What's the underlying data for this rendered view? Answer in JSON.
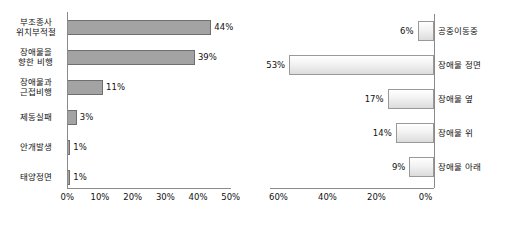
{
  "chart_data": [
    {
      "id": "left",
      "type": "bar",
      "orientation": "horizontal",
      "title": "",
      "xlabel": "",
      "ylabel": "",
      "grid": false,
      "legend": "none",
      "xlim": [
        0,
        50
      ],
      "axis_direction": "normal",
      "tick_labels": [
        "0%",
        "10%",
        "20%",
        "30%",
        "40%",
        "50%"
      ],
      "tick_values": [
        0,
        10,
        20,
        30,
        40,
        50
      ],
      "categories": [
        "부조종사\n위치부적절",
        "장애물을\n향한 비행",
        "장애물과\n근접비행",
        "제동실패",
        "안개발생",
        "태양정면"
      ],
      "values": [
        44,
        39,
        11,
        3,
        1,
        1
      ],
      "value_labels": [
        "44%",
        "39%",
        "11%",
        "3%",
        "1%",
        "1%"
      ],
      "bar_color": "#a3a3a3",
      "bar_border_color": "#6f6f6f"
    },
    {
      "id": "right",
      "type": "bar",
      "orientation": "horizontal",
      "title": "",
      "xlabel": "",
      "ylabel": "",
      "grid": false,
      "legend": "none",
      "xlim": [
        0,
        60
      ],
      "axis_direction": "reversed",
      "tick_labels": [
        "60%",
        "40%",
        "20%",
        "0%"
      ],
      "tick_values": [
        60,
        40,
        20,
        0
      ],
      "categories": [
        "공중이동중",
        "장애물 정면",
        "장애물 옆",
        "장애물 위",
        "장애물 아래"
      ],
      "values": [
        6,
        53,
        17,
        14,
        9
      ],
      "value_labels": [
        "6%",
        "53%",
        "17%",
        "14%",
        "9%"
      ],
      "bar_color": "#eeeeee",
      "bar_border_color": "#999999"
    }
  ]
}
